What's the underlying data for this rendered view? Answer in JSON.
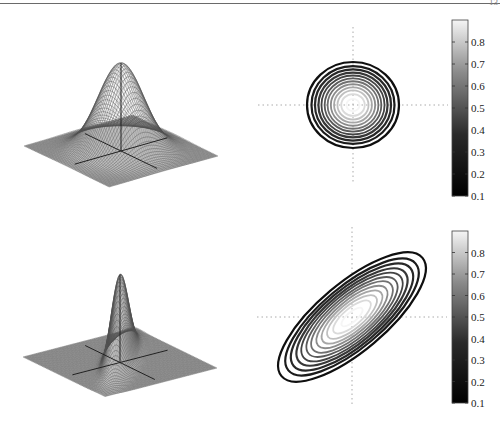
{
  "page": {
    "header_fragment": "13"
  },
  "chart_data": [
    {
      "type": "surface",
      "title": "",
      "description": "3D mesh surface of isotropic 2D Gaussian density (circular)",
      "xlabel": "",
      "ylabel": "",
      "zlabel": "",
      "covariance": [
        [
          1,
          0
        ],
        [
          0,
          1
        ]
      ],
      "mean": [
        0,
        0
      ],
      "peak_value": 0.9
    },
    {
      "type": "contour",
      "title": "",
      "description": "Contour lines of isotropic Gaussian, circular, centered at origin",
      "levels": [
        0.1,
        0.2,
        0.3,
        0.4,
        0.5,
        0.6,
        0.7,
        0.8
      ],
      "shape": "circle",
      "rotation_deg": 0,
      "colorbar": {
        "ticks": [
          "0.8",
          "0.7",
          "0.6",
          "0.5",
          "0.4",
          "0.3",
          "0.2",
          "0.1"
        ],
        "range": [
          0.1,
          0.9
        ],
        "colormap": "gray"
      },
      "grid": "dotted crosshair at origin"
    },
    {
      "type": "surface",
      "title": "",
      "description": "3D mesh surface of correlated 2D Gaussian density (elongated along diagonal)",
      "xlabel": "",
      "ylabel": "",
      "zlabel": "",
      "covariance": [
        [
          1,
          0.9
        ],
        [
          0.9,
          1
        ]
      ],
      "mean": [
        0,
        0
      ],
      "peak_value": 0.9
    },
    {
      "type": "contour",
      "title": "",
      "description": "Contour lines of correlated Gaussian, ellipses rotated along positive diagonal",
      "levels": [
        0.1,
        0.2,
        0.3,
        0.4,
        0.5,
        0.6,
        0.7,
        0.8
      ],
      "shape": "ellipse",
      "rotation_deg": -40,
      "colorbar": {
        "ticks": [
          "0.8",
          "0.7",
          "0.6",
          "0.5",
          "0.4",
          "0.3",
          "0.2",
          "0.1"
        ],
        "range": [
          0.1,
          0.9
        ],
        "colormap": "gray"
      },
      "grid": "dotted crosshair at origin"
    }
  ],
  "colors": {
    "contour_low": "#111111",
    "contour_high": "#f2f2f2",
    "mesh": "#333333",
    "axis": "#222222",
    "crosshair": "#aaaaaa"
  }
}
